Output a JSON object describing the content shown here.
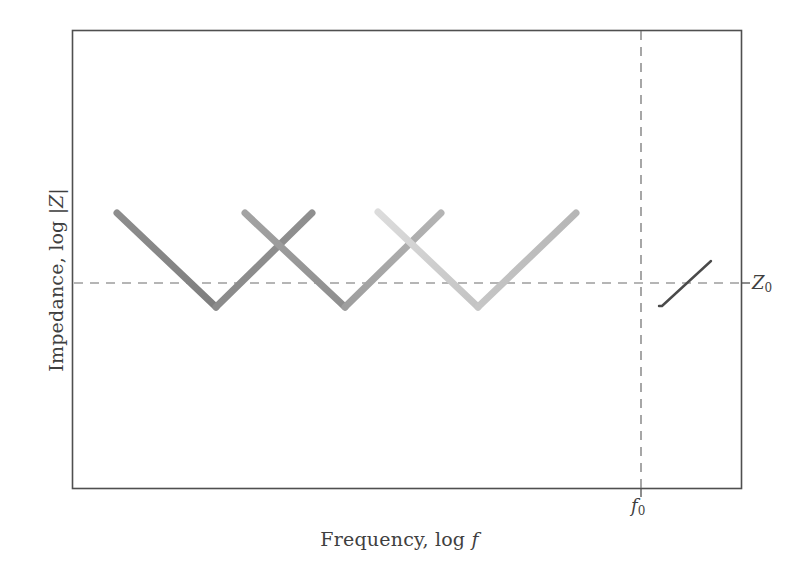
{
  "figure": {
    "background": "#ffffff",
    "axes": {
      "x": 72,
      "y": 30,
      "width": 669,
      "height": 459,
      "frame_color": "#4f4f4f",
      "frame_width": 1.6
    },
    "xlabel_parts": {
      "lead": "Frequency, log ",
      "symbol": "f"
    },
    "ylabel_parts": {
      "lead": "Impedance, log ",
      "symbol": "|Z|"
    },
    "tick_labels": {
      "f0": {
        "symbol": "f",
        "subscript": "0",
        "x": 631,
        "y": 495
      },
      "z0": {
        "symbol": "Z",
        "subscript": "0",
        "x": 752,
        "y": 272
      }
    }
  },
  "chart_data": {
    "type": "line",
    "title": "",
    "xlabel": "Frequency, log f",
    "ylabel": "Impedance, log |Z|",
    "grid": false,
    "legend": null,
    "axis_ticks_numeric": false,
    "axis_ranges": {
      "x": [
        0,
        1
      ],
      "y": [
        0,
        1
      ]
    },
    "reference_lines": [
      {
        "name": "Z0",
        "orientation": "horizontal",
        "y_px": 283,
        "label": "Z_0",
        "style": "dashed",
        "color": "#6d6d6d"
      },
      {
        "name": "f0",
        "orientation": "vertical",
        "x_px": 641,
        "label": "f_0",
        "style": "dashed",
        "color": "#6d6d6d"
      }
    ],
    "baseline": {
      "name": "impedance-baseline",
      "y_px": 306,
      "x_start_px": 76,
      "x_end_px": 662,
      "width": 4.2,
      "color_start": "#4a4a4a",
      "color_end": "#c8c8c8"
    },
    "inductive_upturn": {
      "name": "inductive-upturn",
      "points_px": [
        [
          662,
          306
        ],
        [
          711,
          261
        ]
      ],
      "width": 2.4,
      "color": "#4a4a4a"
    },
    "resonance_segments": [
      {
        "id": 1,
        "kind": "falling",
        "points_px": [
          [
            117,
            213
          ],
          [
            216,
            307
          ]
        ],
        "color": "#8a8a8a",
        "width": 7
      },
      {
        "id": 2,
        "kind": "rising",
        "points_px": [
          [
            216,
            307
          ],
          [
            312,
            213
          ]
        ],
        "color": "#8f8f8f",
        "width": 7
      },
      {
        "id": 3,
        "kind": "falling",
        "points_px": [
          [
            245,
            213
          ],
          [
            345,
            307
          ]
        ],
        "color": "#9a9a9a",
        "width": 7
      },
      {
        "id": 4,
        "kind": "rising",
        "points_px": [
          [
            345,
            307
          ],
          [
            441,
            213
          ]
        ],
        "color": "#a8a8a8",
        "width": 7
      },
      {
        "id": 5,
        "kind": "falling",
        "points_px": [
          [
            378,
            212
          ],
          [
            478,
            307
          ]
        ],
        "color": "#d2d2d2",
        "width": 7
      },
      {
        "id": 6,
        "kind": "rising",
        "points_px": [
          [
            478,
            307
          ],
          [
            576,
            213
          ]
        ],
        "color": "#bdbdbd",
        "width": 7
      }
    ],
    "notch_minima_px": [
      216,
      345,
      478
    ],
    "peak_tops_px": [
      213,
      213,
      212,
      213
    ]
  }
}
